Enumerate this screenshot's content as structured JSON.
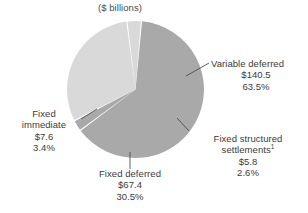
{
  "chart_data": {
    "type": "pie",
    "title": "($ billions)",
    "unit": "$ billions",
    "categories": [
      "Variable deferred",
      "Fixed structured settlements",
      "Fixed deferred",
      "Fixed immediate"
    ],
    "values": [
      140.5,
      5.8,
      67.4,
      7.6
    ],
    "percents": [
      63.5,
      2.6,
      30.5,
      3.4
    ],
    "value_labels": [
      "$140.5",
      "$5.8",
      "$67.4",
      "$7.6"
    ],
    "percent_labels": [
      "63.5%",
      "2.6%",
      "30.5%",
      "3.4%"
    ],
    "colors": [
      "#a9a9a9",
      "#a9a9a9",
      "#d9d9d9",
      "#d9d9d9"
    ],
    "legend": "none",
    "grid": false,
    "footnote_marker": "1",
    "slice_order_clockwise": [
      "Variable deferred",
      "Fixed structured settlements",
      "Fixed deferred",
      "Fixed immediate"
    ],
    "start_angle_deg": -85
  },
  "labels": {
    "variable_deferred": {
      "name": "Variable deferred",
      "value": "$140.5",
      "percent": "63.5%"
    },
    "fixed_structured": {
      "name_line1": "Fixed structured",
      "name_line2": "settlements",
      "footnote": "1",
      "value": "$5.8",
      "percent": "2.6%"
    },
    "fixed_deferred": {
      "name": "Fixed deferred",
      "value": "$67.4",
      "percent": "30.5%"
    },
    "fixed_immediate": {
      "name_line1": "Fixed",
      "name_line2": "immediate",
      "value": "$7.6",
      "percent": "3.4%"
    }
  },
  "colors": {
    "dark_slice": "#a9a9a9",
    "light_slice": "#d9d9d9",
    "leader_line": "#4d4d4d",
    "text": "#3b3b3b",
    "background": "#ffffff"
  }
}
